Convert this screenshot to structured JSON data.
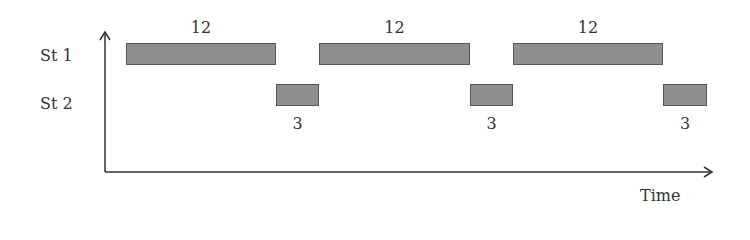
{
  "chart_data": {
    "type": "gantt",
    "title": "",
    "xlabel": "Time",
    "ylabel": "",
    "rows": [
      "St 1",
      "St 2"
    ],
    "series": [
      {
        "name": "St 1",
        "segments": [
          {
            "start": 0,
            "end": 12,
            "label": "12"
          },
          {
            "start": 15,
            "end": 27,
            "label": "12"
          },
          {
            "start": 30,
            "end": 42,
            "label": "12"
          }
        ]
      },
      {
        "name": "St 2",
        "segments": [
          {
            "start": 12,
            "end": 15,
            "label": "3"
          },
          {
            "start": 27,
            "end": 30,
            "label": "3"
          },
          {
            "start": 42,
            "end": 45,
            "label": "3"
          }
        ]
      }
    ],
    "grid": false,
    "legend": "none"
  },
  "labels": {
    "row1": "St 1",
    "row2": "St 2",
    "x_axis": "Time"
  },
  "bars": {
    "st1": [
      {
        "x": 126,
        "w": 150,
        "label": "12"
      },
      {
        "x": 319,
        "w": 151,
        "label": "12"
      },
      {
        "x": 513,
        "w": 150,
        "label": "12"
      }
    ],
    "st2": [
      {
        "x": 276,
        "w": 43,
        "label": "3"
      },
      {
        "x": 470,
        "w": 43,
        "label": "3"
      },
      {
        "x": 663,
        "w": 44,
        "label": "3"
      }
    ]
  },
  "colors": {
    "bar_fill": "#8f8f8f",
    "bar_border": "#555555",
    "axis": "#333333"
  }
}
